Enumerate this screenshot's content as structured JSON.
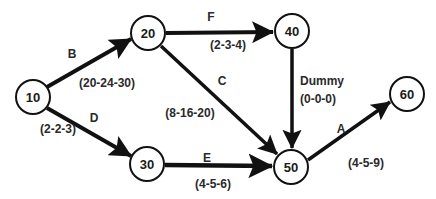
{
  "diagram": {
    "type": "PERT network (activity-on-arrow)",
    "colors": {
      "stroke": "#111111",
      "text": "#222222",
      "background": "#ffffff"
    },
    "nodes": [
      {
        "id": "10",
        "label": "10",
        "x": 33,
        "y": 97
      },
      {
        "id": "20",
        "label": "20",
        "x": 148,
        "y": 33
      },
      {
        "id": "30",
        "label": "30",
        "x": 147,
        "y": 164
      },
      {
        "id": "40",
        "label": "40",
        "x": 292,
        "y": 31
      },
      {
        "id": "50",
        "label": "50",
        "x": 291,
        "y": 167
      },
      {
        "id": "60",
        "label": "60",
        "x": 407,
        "y": 94
      }
    ],
    "edges": [
      {
        "from": "10",
        "to": "20",
        "activity": "B",
        "times": "(20-24-30)"
      },
      {
        "from": "10",
        "to": "30",
        "activity": "D",
        "times": "(2-2-3)"
      },
      {
        "from": "20",
        "to": "40",
        "activity": "F",
        "times": "(2-3-4)"
      },
      {
        "from": "20",
        "to": "50",
        "activity": "C",
        "times": "(8-16-20)"
      },
      {
        "from": "40",
        "to": "50",
        "activity": "Dummy",
        "times": "(0-0-0)"
      },
      {
        "from": "30",
        "to": "50",
        "activity": "E",
        "times": "(4-5-6)"
      },
      {
        "from": "50",
        "to": "60",
        "activity": "A",
        "times": "(4-5-9)"
      }
    ]
  }
}
